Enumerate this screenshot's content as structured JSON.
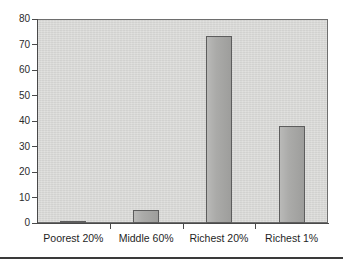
{
  "chart_data": {
    "type": "bar",
    "title": "",
    "subtitle": "",
    "xlabel": "",
    "ylabel": "",
    "categories": [
      "Poorest 20%",
      "Middle 60%",
      "Richest 20%",
      "Richest 1%"
    ],
    "values": [
      0.5,
      5,
      73.5,
      38
    ],
    "series": [
      {
        "name": "Share",
        "values": [
          0.5,
          5,
          73.5,
          38
        ]
      }
    ],
    "ylim": [
      0,
      80
    ],
    "y_ticks": [
      0,
      10,
      20,
      30,
      40,
      50,
      60,
      70,
      80
    ],
    "y_tick_labels": [
      "0",
      "10",
      "20",
      "30",
      "40",
      "50",
      "60",
      "70",
      "80"
    ],
    "grid": false,
    "legend": false,
    "legend_position": "none",
    "annotations": [],
    "colors": {
      "bar_fill": "#a6a6a4",
      "bar_border": "#5d5d5d",
      "plot_background": "#d7d7d5",
      "axis": "#4a4a4a",
      "text": "#1f1f1f",
      "page_background": "#ffffff",
      "rule": "#3a3a3a"
    }
  }
}
